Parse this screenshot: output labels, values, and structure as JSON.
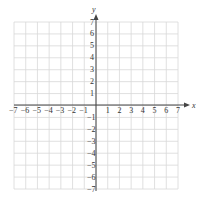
{
  "chart_data": {
    "type": "scatter",
    "title": "",
    "xlabel": "x",
    "ylabel": "y",
    "xlim": [
      -7,
      7
    ],
    "ylim": [
      -7,
      7
    ],
    "grid": true,
    "x_ticks": [
      "-7",
      "-6",
      "-5",
      "-4",
      "-3",
      "-2",
      "-1",
      "1",
      "2",
      "3",
      "4",
      "5",
      "6",
      "7"
    ],
    "y_ticks": [
      "7",
      "6",
      "5",
      "4",
      "3",
      "2",
      "1",
      "-1",
      "-2",
      "-3",
      "-4",
      "-5",
      "-6",
      "-7"
    ],
    "series": [],
    "colors": {
      "grid": "#d8d8d8",
      "axis": "#444444",
      "text": "#333333"
    }
  },
  "axes": {
    "x_label": "x",
    "y_label": "y"
  }
}
